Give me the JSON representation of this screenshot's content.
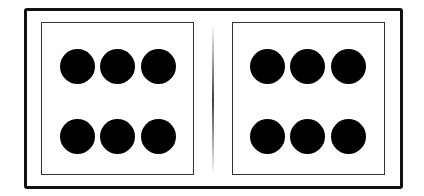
{
  "diagram": {
    "colors": {
      "background": "#ffffff",
      "frame": "#111111",
      "panel_border": "#333333",
      "pip": "#000000"
    },
    "halves": [
      {
        "name": "left",
        "pip_count": 6,
        "rows": 2,
        "cols": 3,
        "pips": [
          {
            "cx": 77,
            "cy": 66
          },
          {
            "cx": 117,
            "cy": 66
          },
          {
            "cx": 158,
            "cy": 66
          },
          {
            "cx": 77,
            "cy": 136
          },
          {
            "cx": 117,
            "cy": 136
          },
          {
            "cx": 158,
            "cy": 136
          }
        ]
      },
      {
        "name": "right",
        "pip_count": 6,
        "rows": 2,
        "cols": 3,
        "pips": [
          {
            "cx": 267,
            "cy": 66
          },
          {
            "cx": 307,
            "cy": 66
          },
          {
            "cx": 348,
            "cy": 66
          },
          {
            "cx": 267,
            "cy": 136
          },
          {
            "cx": 307,
            "cy": 136
          },
          {
            "cx": 348,
            "cy": 136
          }
        ]
      }
    ],
    "pip_diameter": 35
  }
}
